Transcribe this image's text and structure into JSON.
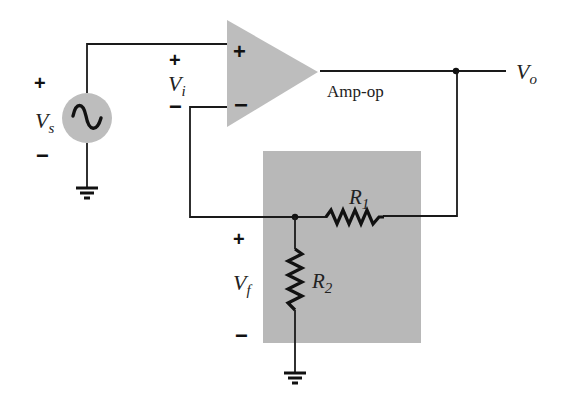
{
  "diagram": {
    "type": "non-inverting op-amp with voltage-divider feedback network",
    "colors": {
      "wire": "#1a1a1a",
      "component_fill": "#bdbdbd",
      "feedback_box": "#b8b8b8",
      "background": "#ffffff"
    },
    "source": {
      "label": "V",
      "subscript": "s",
      "plus": "+",
      "minus": "−",
      "symbol": "ac-sine"
    },
    "input": {
      "label": "V",
      "subscript": "i",
      "plus": "+",
      "minus": "−"
    },
    "opamp": {
      "label": "Amp-op",
      "noninverting": "+",
      "inverting": "−"
    },
    "output": {
      "label": "V",
      "subscript": "o"
    },
    "feedback": {
      "r1": {
        "label": "R",
        "subscript": "1"
      },
      "r2": {
        "label": "R",
        "subscript": "2"
      },
      "vf": {
        "label": "V",
        "subscript": "f",
        "plus": "+",
        "minus": "−"
      }
    }
  }
}
